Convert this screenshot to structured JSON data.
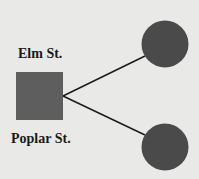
{
  "labels": {
    "top": "Elm St.",
    "bottom": "Poplar St."
  },
  "colors": {
    "background": "#e9e9e7",
    "square_fill": "#5e5e5e",
    "circle_fill": "#4a4a4a",
    "line": "#1a1a1a",
    "text": "#1a1a1a"
  },
  "shapes": {
    "square": {
      "x": 16,
      "y": 72,
      "width": 47,
      "height": 48
    },
    "circles": [
      {
        "cx": 165,
        "cy": 44,
        "r": 23.5
      },
      {
        "cx": 165,
        "cy": 147,
        "r": 23.5
      }
    ],
    "lines": [
      {
        "x1": 63,
        "y1": 96,
        "x2": 145,
        "y2": 56
      },
      {
        "x1": 63,
        "y1": 96,
        "x2": 145,
        "y2": 135
      }
    ]
  }
}
